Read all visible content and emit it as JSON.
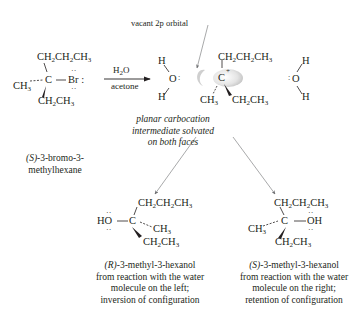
{
  "labels": {
    "vacant_orbital": "vacant 2p orbital",
    "reagent_top": "H2O",
    "reagent_bottom": "acetone",
    "intermediate_caption": [
      "planar carbocation",
      "intermediate solvated",
      "on both faces"
    ],
    "starting_material_name": [
      "(S)-3-bromo-3-",
      "methylhexane"
    ],
    "product_left_caption": [
      "(R)-3-methyl-3-hexanol",
      "from reaction with the water",
      "molecule on the left;",
      "inversion of configuration"
    ],
    "product_right_caption": [
      "(S)-3-methyl-3-hexanol",
      "from reaction with the water",
      "molecule on the right;",
      "retention of configuration"
    ]
  },
  "molecules": {
    "starting": {
      "center": "C",
      "top": "CH2CH2CH3",
      "left": "CH3",
      "right": "Br",
      "bottom": "CH2CH3"
    },
    "carbocation": {
      "center": "C+",
      "top": "CH2CH2CH3",
      "bottom_left": "CH3",
      "bottom_right": "CH2CH3"
    },
    "water_left": {
      "atoms": [
        "H",
        "O",
        "H"
      ]
    },
    "water_right": {
      "atoms": [
        "H",
        "O",
        "H"
      ]
    },
    "product_left": {
      "center": "C",
      "top": "CH2CH2CH3",
      "left": "HO",
      "right": "CH3",
      "bottom": "CH2CH3"
    },
    "product_right": {
      "center": "C",
      "top": "CH2CH2CH3",
      "left": "CH3",
      "right": "OH",
      "bottom": "CH2CH3"
    }
  },
  "text": {
    "CH2CH2CH3_a": "CH",
    "CH3": "CH",
    "C": "C",
    "Br": "Br",
    "H": "H",
    "O": "O",
    "HO": "HO",
    "OH": "OH",
    "sub2": "2",
    "sub3": "3",
    "colon": ":",
    "plus": "+"
  }
}
